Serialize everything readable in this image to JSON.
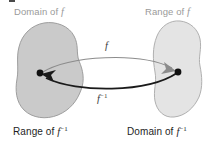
{
  "figure": {
    "title_labels": {
      "top_left": "Domain of",
      "top_right": "Range of",
      "bottom_left": "Range of",
      "bottom_right": "Domain of"
    },
    "function_symbol": "f",
    "inverse_symbol": "f",
    "inverse_exponent": "−1",
    "curve_labels": {
      "upper": "f",
      "lower": "f"
    },
    "colors": {
      "left_blob_fill": "#cacaca",
      "left_blob_stroke": "#9e9e9e",
      "right_blob_fill": "#e4e4e4",
      "right_blob_stroke": "#b0b0b0",
      "upper_arrow": "#8c8c8c",
      "lower_arrow": "#1a1a1a",
      "point": "#111111",
      "label_top": "#9a9a9a",
      "label_bottom": "#1e1e1e",
      "background": "#ffffff"
    },
    "points": {
      "left": {
        "x": 40,
        "y": 73
      },
      "right": {
        "x": 178,
        "y": 72
      }
    }
  }
}
